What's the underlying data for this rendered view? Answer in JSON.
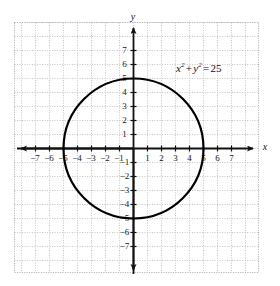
{
  "chart_data": {
    "type": "scatter",
    "title": "",
    "xlabel": "x",
    "ylabel": "y",
    "xlim": [
      -7.9,
      7.9
    ],
    "ylim": [
      -7.9,
      7.9
    ],
    "grid": true,
    "grid_style": "dotted",
    "legend": "none",
    "xticks": [
      -7,
      -6,
      -5,
      -4,
      -3,
      -2,
      -1,
      1,
      2,
      3,
      4,
      5,
      6,
      7
    ],
    "yticks": [
      7,
      6,
      5,
      4,
      3,
      2,
      1,
      -1,
      -2,
      -3,
      -4,
      -5,
      -6,
      -7
    ],
    "xtick_labels": [
      "−7",
      "−6",
      "−5",
      "−4",
      "−3",
      "−2",
      "−1",
      "1",
      "2",
      "3",
      "4",
      "5",
      "6",
      "7"
    ],
    "ytick_labels": [
      "7",
      "6",
      "5",
      "4",
      "3",
      "2",
      "1",
      "−1",
      "−2",
      "−3",
      "−4",
      "−5",
      "−6",
      "−7"
    ],
    "annotations": [
      {
        "name": "equation-label",
        "text": "x² + y² = 25",
        "x": 3.6,
        "y": 6.0
      }
    ],
    "series": [
      {
        "name": "circle",
        "shape": "circle",
        "equation": "x^2 + y^2 = 25",
        "center": [
          0,
          0
        ],
        "radius": 5,
        "stroke": "#000000",
        "stroke_width": 2.2,
        "fill": "none"
      }
    ]
  },
  "figure": {
    "equation": {
      "var_x": "x",
      "exp_x": "2",
      "plus": "+",
      "var_y": "y",
      "exp_y": "2",
      "equals": "=",
      "value": "25"
    },
    "axis_labels": {
      "x": "x",
      "y": "y"
    },
    "colors": {
      "background": "#ffffff",
      "grid": "#c9c9c9",
      "axis": "#111111",
      "curve": "#000000",
      "text": "#1a1a1a"
    },
    "x_tick_labels": [
      "−7",
      "−6",
      "−5",
      "−4",
      "−3",
      "−2",
      "−1",
      "1",
      "2",
      "3",
      "4",
      "5",
      "6",
      "7"
    ],
    "y_tick_labels": [
      "7",
      "6",
      "5",
      "4",
      "3",
      "2",
      "1",
      "−1",
      "−2",
      "−3",
      "−4",
      "−5",
      "−6",
      "−7"
    ]
  }
}
